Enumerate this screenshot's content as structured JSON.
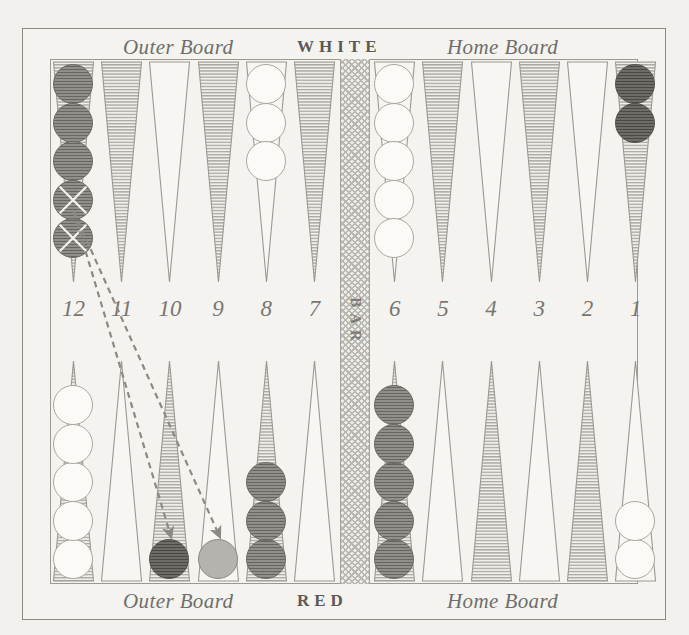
{
  "figure": {
    "top_labels": {
      "outer_board": "Outer Board",
      "player": "WHITE",
      "home_board": "Home Board"
    },
    "bottom_labels": {
      "outer_board": "Outer Board",
      "player": "RED",
      "home_board": "Home Board"
    },
    "bar_label": "BAR",
    "point_numbers": [
      "12",
      "11",
      "10",
      "9",
      "8",
      "7",
      "6",
      "5",
      "4",
      "3",
      "2",
      "1"
    ],
    "colors": {
      "paper": "#f2f1ee",
      "frame": "#8a8a84",
      "point_shaded": "#b6b4ae",
      "point_plain": "#f7f6f3",
      "point_outline": "#9a9994",
      "checker_white": "#fbfaf7",
      "checker_red": "#918f89",
      "checker_red_dark": "#6e6c66",
      "checker_ghost": "#b5b3ad",
      "arrow": "#8c8a84",
      "text": "#6f6e6a"
    },
    "top_points": [
      {
        "number": "12",
        "shaded": true,
        "checkers": 5,
        "color": "red",
        "marked_from_bottom": 2
      },
      {
        "number": "11",
        "shaded": true,
        "checkers": 0,
        "color": "none",
        "marked_from_bottom": 0
      },
      {
        "number": "10",
        "shaded": false,
        "checkers": 0,
        "color": "none",
        "marked_from_bottom": 0
      },
      {
        "number": "9",
        "shaded": true,
        "checkers": 0,
        "color": "none",
        "marked_from_bottom": 0
      },
      {
        "number": "8",
        "shaded": false,
        "checkers": 3,
        "color": "white",
        "marked_from_bottom": 0
      },
      {
        "number": "7",
        "shaded": true,
        "checkers": 0,
        "color": "none",
        "marked_from_bottom": 0
      },
      {
        "number": "6",
        "shaded": false,
        "checkers": 5,
        "color": "white",
        "marked_from_bottom": 0
      },
      {
        "number": "5",
        "shaded": true,
        "checkers": 0,
        "color": "none",
        "marked_from_bottom": 0
      },
      {
        "number": "4",
        "shaded": false,
        "checkers": 0,
        "color": "none",
        "marked_from_bottom": 0
      },
      {
        "number": "3",
        "shaded": true,
        "checkers": 0,
        "color": "none",
        "marked_from_bottom": 0
      },
      {
        "number": "2",
        "shaded": false,
        "checkers": 0,
        "color": "none",
        "marked_from_bottom": 0
      },
      {
        "number": "1",
        "shaded": true,
        "checkers": 2,
        "color": "reddark",
        "marked_from_bottom": 0
      }
    ],
    "bottom_points": [
      {
        "number": "12",
        "shaded": true,
        "checkers": 5,
        "color": "white",
        "marked_from_bottom": 0
      },
      {
        "number": "11",
        "shaded": false,
        "checkers": 0,
        "color": "none",
        "marked_from_bottom": 0
      },
      {
        "number": "10",
        "shaded": true,
        "checkers": 1,
        "color": "reddark",
        "marked_from_bottom": 0
      },
      {
        "number": "9",
        "shaded": false,
        "checkers": 1,
        "color": "ghost",
        "marked_from_bottom": 0
      },
      {
        "number": "8",
        "shaded": true,
        "checkers": 3,
        "color": "red",
        "marked_from_bottom": 0
      },
      {
        "number": "7",
        "shaded": false,
        "checkers": 0,
        "color": "none",
        "marked_from_bottom": 0
      },
      {
        "number": "6",
        "shaded": true,
        "checkers": 5,
        "color": "red",
        "marked_from_bottom": 0
      },
      {
        "number": "5",
        "shaded": false,
        "checkers": 0,
        "color": "none",
        "marked_from_bottom": 0
      },
      {
        "number": "4",
        "shaded": true,
        "checkers": 0,
        "color": "none",
        "marked_from_bottom": 0
      },
      {
        "number": "3",
        "shaded": false,
        "checkers": 0,
        "color": "none",
        "marked_from_bottom": 0
      },
      {
        "number": "2",
        "shaded": true,
        "checkers": 0,
        "color": "none",
        "marked_from_bottom": 0
      },
      {
        "number": "1",
        "shaded": false,
        "checkers": 2,
        "color": "white",
        "marked_from_bottom": 0
      }
    ],
    "move_arrows": [
      {
        "from_point": "12",
        "from_side": "top",
        "to_point": "10",
        "to_side": "bottom"
      },
      {
        "from_point": "12",
        "from_side": "top",
        "to_point": "9",
        "to_side": "bottom"
      }
    ]
  }
}
